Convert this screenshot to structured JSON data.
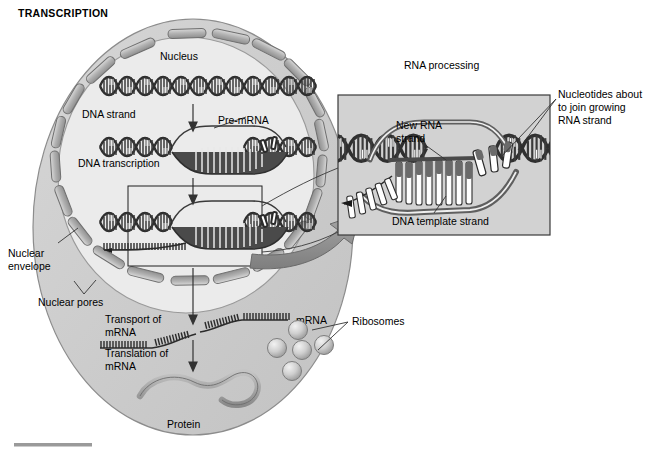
{
  "figure": {
    "title": "TRANSCRIPTION",
    "bottom_rule": true
  },
  "colors": {
    "cytoplasm": "#c9c9c9",
    "nucleus": "#e3e3e3",
    "pore": "#b4b4b4",
    "inset_bg": "#d2d2d2",
    "arrow_gray": "#8e8e8e",
    "outline": "#555555",
    "text": "#000000",
    "helix_dark": "#3a3a3a",
    "helix_light": "#ffffff",
    "ribosome": "#bdbdbd",
    "protein": "#9a9a9a"
  },
  "cell": {
    "nucleus_label": "Nucleus",
    "nuclear_envelope_label": "Nuclear\nenvelope",
    "nuclear_envelope_line1": "Nuclear",
    "nuclear_envelope_line2": "envelope",
    "nuclear_pores_label": "Nuclear pores",
    "pore_count": 20
  },
  "stages": [
    {
      "id": "dna-strand",
      "label": "DNA strand"
    },
    {
      "id": "dna-transcription",
      "label": "DNA transcription"
    },
    {
      "id": "pre-mrna",
      "label": "Pre-mRNA"
    },
    {
      "id": "transport",
      "label_line1": "Transport of",
      "label_line2": "mRNA"
    },
    {
      "id": "translation",
      "label_line1": "Translation of",
      "label_line2": "mRNA"
    }
  ],
  "cytoplasm": {
    "mrna_label": "mRNA",
    "ribosomes_label": "Ribosomes",
    "ribosome_count": 5,
    "protein_label": "Protein"
  },
  "inset": {
    "title": "RNA processing",
    "new_rna_line1": "New RNA",
    "new_rna_line2": "strand",
    "dna_template_label": "DNA template strand",
    "nucleotides_line1": "Nucleotides about",
    "nucleotides_line2": "to join growing",
    "nucleotides_line3": "RNA strand"
  }
}
